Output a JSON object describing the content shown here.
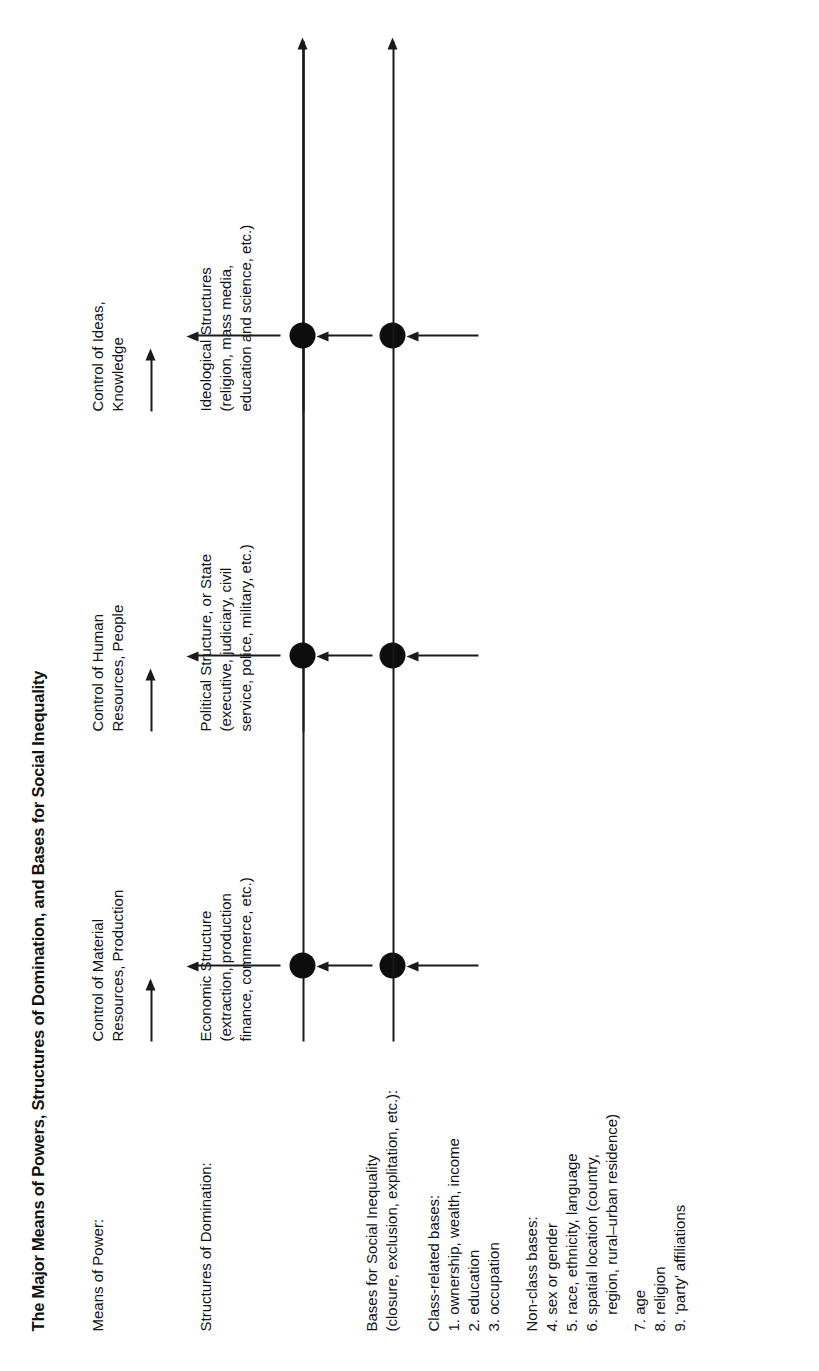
{
  "figure": {
    "title": "The Major Means of Powers, Structures of Domination, and Bases for Social Inequality",
    "row_labels": {
      "means_of_power": "Means of Power:",
      "structures_of_domination": "Structures of Domination:",
      "bases_heading_line1": "Bases for Social Inequality",
      "bases_heading_line2": "(closure, exclusion, explitation, etc.):"
    },
    "columns": [
      {
        "id": "economic",
        "power_line1": "Control of Material",
        "power_line2": "Resources, Production",
        "structure_line1": "Economic Structure",
        "structure_line2": "(extraction, production",
        "structure_line3": "finance, commerce, etc.)"
      },
      {
        "id": "political",
        "power_line1": "Control of Human",
        "power_line2": "Resources, People",
        "structure_line1": "Political Structure, or State",
        "structure_line2": "(executive, judiciary, civil",
        "structure_line3": "service, police, military, etc.)"
      },
      {
        "id": "ideological",
        "power_line1": "Control of Ideas,",
        "power_line2": "Knowledge",
        "structure_line1": "Ideological Structures",
        "structure_line2": "(religion, mass media,",
        "structure_line3": "education and science, etc.)"
      }
    ],
    "bases": {
      "class_related": {
        "heading": "Class-related bases:",
        "items": [
          "1. ownership, wealth, income",
          "2. education",
          "3. occupation"
        ]
      },
      "non_class": {
        "heading": "Non-class bases:",
        "items": [
          "4. sex or gender",
          "5. race, ethnicity, language",
          "6. spatial location (country,",
          "    region, rural–urban residence)",
          "7. age",
          "8. religion",
          "9. ‘party’ affiliations"
        ]
      }
    },
    "colors": {
      "ink": "#111111",
      "paper": "#ffffff"
    }
  }
}
